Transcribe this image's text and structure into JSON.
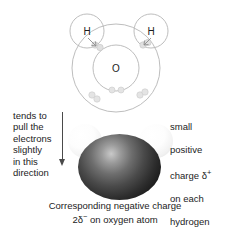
{
  "figure": {
    "background_color": "#ffffff"
  },
  "shell_diagram": {
    "oxygen_label": "O",
    "hydrogen_left_label": "H",
    "hydrogen_right_label": "H",
    "shell_stroke_color": "#b0b0b0",
    "electron_color": "#d8d8d8"
  },
  "space_filling_model": {
    "oxygen_color": "#1a1a1a",
    "hydrogen_color": "#f4f4f4"
  },
  "annotations": {
    "left_label": "tends to\npull the\nelectrons\nslightly\nin this\ndirection",
    "right_label_line1": "small",
    "right_label_line2": "positive",
    "right_label_line3_prefix": "charge ",
    "right_label_line3_symbol": "δ",
    "right_label_line3_sup": "+",
    "right_label_line4": "on each",
    "right_label_line5": "hydrogen",
    "right_label_line6": "atom",
    "arrow_direction": "down",
    "arrow_color": "#4a4a4a"
  },
  "bottom_caption": {
    "line1": "Corresponding negative charge",
    "line2_prefix": "2",
    "line2_symbol": "δ",
    "line2_sup": "−",
    "line2_suffix": " on oxygen atom"
  }
}
